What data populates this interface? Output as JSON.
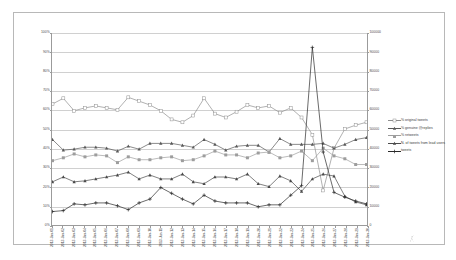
{
  "chart_data": {
    "type": "line",
    "title": "",
    "xlabel": "",
    "ylabel": "",
    "grid": true,
    "legend_position": "right",
    "x": [
      "2013-Jun-01",
      "2013-Jun-02",
      "2013-Jun-03",
      "2013-Jun-04",
      "2013-Jun-05",
      "2013-Jun-06",
      "2013-Jun-07",
      "2013-Jun-08",
      "2013-Jun-09",
      "2013-Jun-10",
      "2013-Jun-11",
      "2013-Jun-12",
      "2013-Jun-13",
      "2013-Jun-14",
      "2013-Jun-15",
      "2013-Jun-16",
      "2013-Jun-17",
      "2013-Jun-18",
      "2013-Jun-19",
      "2013-Jun-20",
      "2013-Jun-21",
      "2013-Jun-22",
      "2013-Jun-23",
      "2013-Jun-24",
      "2013-Jun-25",
      "2013-Jun-26",
      "2013-Jun-27",
      "2013-Jun-28",
      "2013-Jun-29",
      "2013-Jun-30"
    ],
    "left_axis": {
      "label": "",
      "ticks": [
        "0%",
        "10%",
        "20%",
        "30%",
        "40%",
        "50%",
        "60%",
        "70%",
        "80%",
        "90%",
        "100%"
      ],
      "min": 0,
      "max": 100,
      "unit": "%"
    },
    "right_axis": {
      "label": "",
      "ticks": [
        "0",
        "10000",
        "20000",
        "30000",
        "40000",
        "50000",
        "60000",
        "70000",
        "80000",
        "90000",
        "100000"
      ],
      "min": 0,
      "max": 100000
    },
    "series": [
      {
        "name": "% original tweets",
        "axis": "left",
        "marker": "square-open",
        "color": "#8f8f8f",
        "values": [
          63,
          66,
          59.5,
          61,
          62,
          61,
          60,
          66.5,
          64.5,
          62.5,
          59.5,
          55,
          53.5,
          57,
          66,
          58,
          56,
          59,
          62.5,
          61,
          62,
          58.5,
          61,
          56,
          47,
          18,
          40,
          50,
          52,
          53.5
        ]
      },
      {
        "name": "% genuine @replies",
        "axis": "left",
        "marker": "triangle",
        "color": "#585858",
        "values": [
          44.5,
          39,
          39.5,
          40.5,
          40.5,
          40,
          38.5,
          41,
          39.5,
          42.5,
          42.5,
          42.5,
          41.5,
          40.5,
          44.5,
          42,
          39,
          41,
          41.5,
          41.5,
          38,
          45,
          42,
          42,
          42,
          42.5,
          40,
          42,
          44.5,
          45.5
        ]
      },
      {
        "name": "% retweets",
        "axis": "left",
        "marker": "square-filled",
        "color": "#9d9d9d",
        "values": [
          33.5,
          35,
          37,
          35.5,
          36.5,
          36,
          32.5,
          35.5,
          34,
          34,
          35,
          35.5,
          33.5,
          34,
          36,
          38.5,
          36.5,
          36.5,
          35,
          37.5,
          38,
          35,
          36,
          38.5,
          33.5,
          40,
          36,
          34.5,
          31.5,
          31.5
        ]
      },
      {
        "name": "N. of tweets from lead users",
        "axis": "right",
        "marker": "triangle",
        "color": "#4a4a4a",
        "values": [
          22500,
          25000,
          22500,
          23000,
          24000,
          25000,
          26000,
          27500,
          24000,
          26000,
          24000,
          24000,
          26500,
          22500,
          21500,
          25000,
          25000,
          24000,
          26500,
          21500,
          20000,
          25500,
          23000,
          17500,
          24000,
          26500,
          25500,
          15000,
          12000,
          10500
        ]
      },
      {
        "name": "tweets",
        "axis": "right",
        "marker": "plus",
        "color": "#2a2a2a",
        "values": [
          7000,
          7500,
          11000,
          10500,
          11500,
          11500,
          10000,
          8000,
          11500,
          13500,
          19500,
          16500,
          13500,
          11000,
          15500,
          12500,
          11500,
          11500,
          11500,
          9500,
          10500,
          10500,
          15500,
          20500,
          92500,
          38000,
          17000,
          14500,
          12500,
          11000
        ]
      }
    ],
    "annotations": [
      {
        "text": "spike on 2013-Jun-25",
        "series": "tweets",
        "x": "2013-Jun-25",
        "y": 92500
      }
    ]
  },
  "legend": {
    "items": [
      {
        "label": "% original tweets"
      },
      {
        "label": "% genuine @replies"
      },
      {
        "label": "% retweets"
      },
      {
        "label": "N. of tweets from lead users"
      },
      {
        "label": "tweets"
      }
    ]
  }
}
